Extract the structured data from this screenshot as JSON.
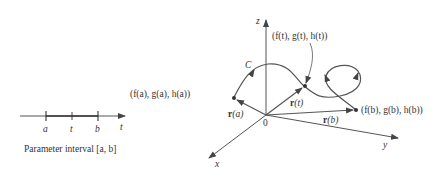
{
  "parameter_interval": {
    "caption": "Parameter interval [a, b]",
    "tick_labels": {
      "a": "a",
      "t": "t",
      "b": "b"
    },
    "axis_label": "t"
  },
  "space_curve": {
    "axes": {
      "x": "x",
      "y": "y",
      "z": "z"
    },
    "origin_label": "0",
    "curve_label": "C",
    "points": {
      "start": "(f(a), g(a), h(a))",
      "middle": "(f(t), g(t), h(t))",
      "end": "(f(b), g(b), h(b))"
    },
    "vectors": {
      "ra_bold": "r",
      "ra_arg": "(a)",
      "rt_bold": "r",
      "rt_arg": "(t)",
      "rb_bold": "r",
      "rb_arg": "(b)"
    }
  },
  "colors": {
    "line": "#555555",
    "text": "#333333"
  }
}
